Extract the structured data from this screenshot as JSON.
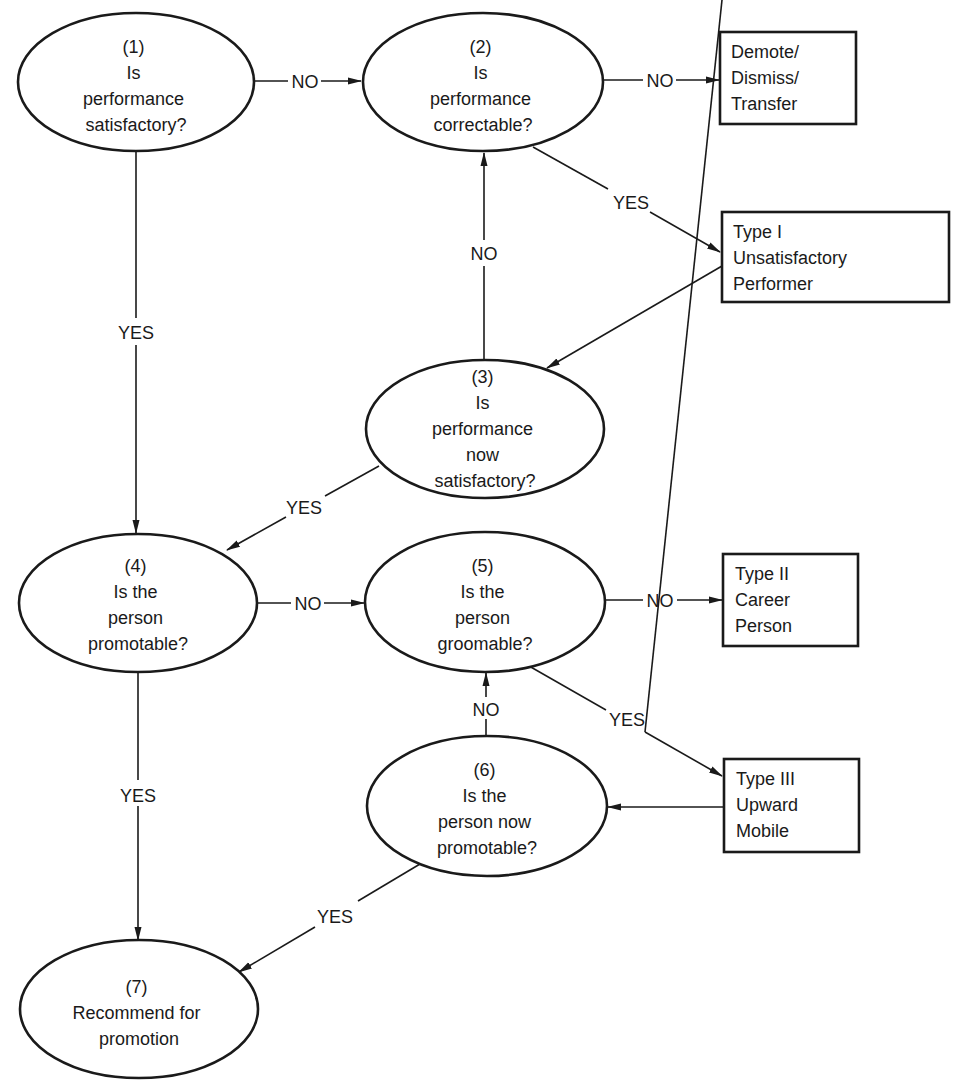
{
  "diagram": {
    "type": "flowchart",
    "colors": {
      "stroke": "#1a1a1a",
      "background": "#ffffff"
    },
    "nodes": [
      {
        "id": "n1",
        "shape": "ellipse",
        "lines": [
          "(1)",
          "Is",
          "performance",
          "satisfactory?"
        ]
      },
      {
        "id": "n2",
        "shape": "ellipse",
        "lines": [
          "(2)",
          "Is",
          "performance",
          "correctable?"
        ]
      },
      {
        "id": "n3",
        "shape": "ellipse",
        "lines": [
          "(3)",
          "Is",
          "performance",
          "now",
          "satisfactory?"
        ]
      },
      {
        "id": "n4",
        "shape": "ellipse",
        "lines": [
          "(4)",
          "Is the",
          "person",
          "promotable?"
        ]
      },
      {
        "id": "n5",
        "shape": "ellipse",
        "lines": [
          "(5)",
          "Is the",
          "person",
          "groomable?"
        ]
      },
      {
        "id": "n6",
        "shape": "ellipse",
        "lines": [
          "(6)",
          "Is the",
          "person now",
          "promotable?"
        ]
      },
      {
        "id": "n7",
        "shape": "ellipse",
        "lines": [
          "(7)",
          "Recommend for",
          "promotion"
        ]
      },
      {
        "id": "demote",
        "shape": "box",
        "lines": [
          "Demote/",
          "Dismiss/",
          "Transfer"
        ]
      },
      {
        "id": "type1",
        "shape": "box",
        "lines": [
          "Type I",
          "Unsatisfactory",
          "Performer"
        ]
      },
      {
        "id": "type2",
        "shape": "box",
        "lines": [
          "Type II",
          "Career",
          "Person"
        ]
      },
      {
        "id": "type3",
        "shape": "box",
        "lines": [
          "Type III",
          "Upward",
          "Mobile"
        ]
      }
    ],
    "edges": [
      {
        "from": "n1",
        "to": "n2",
        "label": "NO"
      },
      {
        "from": "n2",
        "to": "demote",
        "label": "NO"
      },
      {
        "from": "n2",
        "to": "type1",
        "label": "YES"
      },
      {
        "from": "type1",
        "to": "n3",
        "label": ""
      },
      {
        "from": "n3",
        "to": "n2",
        "label": "NO"
      },
      {
        "from": "n1",
        "to": "n4",
        "label": "YES"
      },
      {
        "from": "n3",
        "to": "n4",
        "label": "YES"
      },
      {
        "from": "n4",
        "to": "n5",
        "label": "NO"
      },
      {
        "from": "n5",
        "to": "type2",
        "label": "NO"
      },
      {
        "from": "n5",
        "to": "type3",
        "label": "YES"
      },
      {
        "from": "type3",
        "to": "n6",
        "label": ""
      },
      {
        "from": "n6",
        "to": "n5",
        "label": "NO"
      },
      {
        "from": "n4",
        "to": "n7",
        "label": "YES"
      },
      {
        "from": "n6",
        "to": "n7",
        "label": "YES"
      }
    ]
  }
}
